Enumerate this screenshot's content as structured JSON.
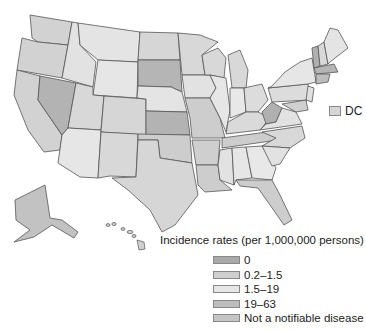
{
  "colors": {
    "c0": "#a9a9a9",
    "c1": "#cfcfcf",
    "c2": "#e6e6e6",
    "c3": "#bdbdbd",
    "cn": "#c4c4c4"
  },
  "dc_label": "DC",
  "legend": {
    "title": "Incidence rates (per 1,000,000 persons)",
    "items": [
      {
        "label": "0",
        "color": "#a9a9a9"
      },
      {
        "label": "0.2–1.5",
        "color": "#cfcfcf"
      },
      {
        "label": "1.5–19",
        "color": "#e6e6e6"
      },
      {
        "label": "19–63",
        "color": "#bdbdbd"
      },
      {
        "label": "Not a notifiable disease",
        "color": "#c4c4c4"
      }
    ]
  }
}
